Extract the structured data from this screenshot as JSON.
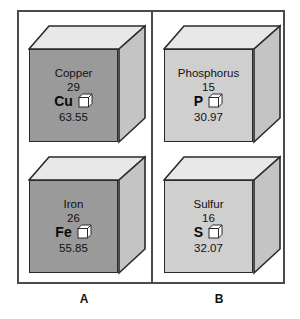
{
  "figure": {
    "panels": [
      {
        "id": "A",
        "label": "A",
        "cubes": [
          {
            "name": "Copper",
            "atomic_number": "29",
            "symbol": "Cu",
            "atomic_mass": "63.55",
            "face_shade": "dark",
            "face_color": "#9a9a9a"
          },
          {
            "name": "Iron",
            "atomic_number": "26",
            "symbol": "Fe",
            "atomic_mass": "55.85",
            "face_shade": "dark",
            "face_color": "#9a9a9a"
          }
        ]
      },
      {
        "id": "B",
        "label": "B",
        "cubes": [
          {
            "name": "Phosphorus",
            "atomic_number": "15",
            "symbol": "P",
            "atomic_mass": "30.97",
            "face_shade": "light",
            "face_color": "#cfcfcf"
          },
          {
            "name": "Sulfur",
            "atomic_number": "16",
            "symbol": "S",
            "atomic_mass": "32.07",
            "face_shade": "light",
            "face_color": "#cfcfcf"
          }
        ]
      }
    ],
    "icons": {
      "mini_cube": "cube-icon"
    },
    "colors": {
      "frame_border": "#4a4a4a",
      "cube_outline": "#2a2a2a",
      "cube_top_face": "#e8e8e8",
      "cube_side_face": "#c4c4c4",
      "dark_front_face": "#9a9a9a",
      "light_front_face": "#cfcfcf",
      "background": "#ffffff",
      "text": "#111111"
    }
  }
}
